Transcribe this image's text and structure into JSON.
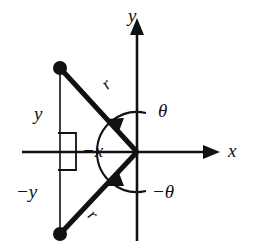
{
  "figure": {
    "kind": "polar-coordinate-diagram",
    "background_color": "#ffffff",
    "stroke_color": "#111111",
    "axes": {
      "x_axis_label": "x",
      "y_axis_label": "y",
      "origin": {
        "x": 137,
        "y": 152
      },
      "x_axis_span": {
        "x1": 22,
        "x2": 220
      },
      "y_axis_span": {
        "y1": 18,
        "y2": 241
      }
    },
    "labels": {
      "theta": "θ",
      "negative_theta": "−θ",
      "radius_upper": "r",
      "radius_lower": "r",
      "y_segment": "y",
      "negative_y_segment": "−y",
      "negative_x_segment": "−x"
    },
    "rays": [
      {
        "name": "upper-ray",
        "from": {
          "x": 137,
          "y": 152
        },
        "to": {
          "x": 60,
          "y": 68
        },
        "angle_deg": 132,
        "endpoint_marker": "filled-dot"
      },
      {
        "name": "lower-ray",
        "from": {
          "x": 137,
          "y": 152
        },
        "to": {
          "x": 60,
          "y": 234
        },
        "angle_deg": -133,
        "endpoint_marker": "filled-dot"
      }
    ],
    "arcs": [
      {
        "name": "theta-arc",
        "direction": "counterclockwise",
        "from_deg": 0,
        "to_deg": 132,
        "radius": 40
      },
      {
        "name": "negative-theta-arc",
        "direction": "clockwise",
        "from_deg": 0,
        "to_deg": -133,
        "radius": 40
      }
    ],
    "right_angle_marker": {
      "x": 58,
      "y": 133,
      "width": 18,
      "height": 37
    },
    "vertical_connector": {
      "x": 60,
      "y1": 68,
      "y2": 234
    }
  }
}
